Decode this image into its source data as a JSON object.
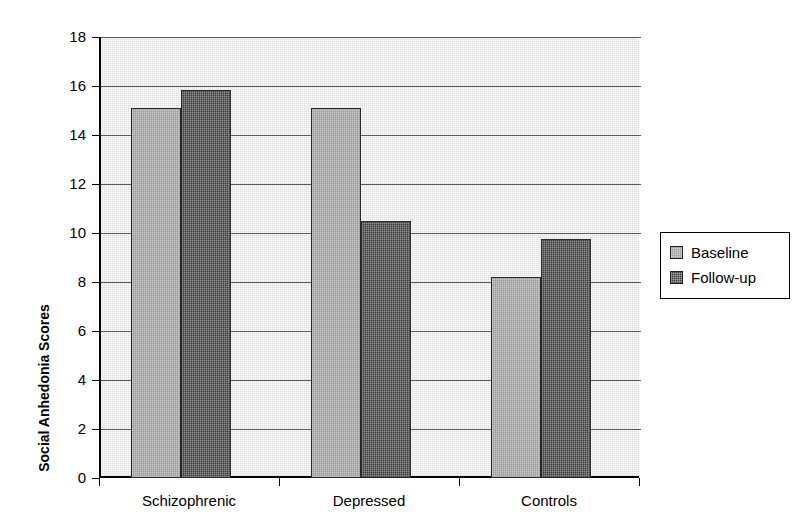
{
  "chart_data": {
    "type": "bar",
    "title": "",
    "subtitle": "",
    "xlabel": "",
    "ylabel": "Social Anhedonia Scores",
    "categories": [
      "Schizophrenic",
      "Depressed",
      "Controls"
    ],
    "series": [
      {
        "name": "Baseline",
        "values": [
          15.1,
          15.1,
          8.2
        ],
        "color": "#9c9c9c"
      },
      {
        "name": "Follow-up",
        "values": [
          15.85,
          10.5,
          9.75
        ],
        "color": "#3d3d3d"
      }
    ],
    "ylim": [
      0,
      18
    ],
    "ytick_step": 2,
    "ytick_labels": [
      "18",
      "16",
      "14",
      "12",
      "10",
      "8",
      "6",
      "4",
      "2",
      "0"
    ],
    "ytick_values": [
      18,
      16,
      14,
      12,
      10,
      8,
      6,
      4,
      2,
      0
    ],
    "grid": "horizontal",
    "legend_position": "right",
    "plot_background_color": "#dedede",
    "axis_color": "#000000",
    "gridline_color": "#5b5b5b",
    "figure_background_color": "#ffffff"
  },
  "legend": {
    "entries": [
      {
        "label": "Baseline",
        "swatch_icon": "square-swatch-light"
      },
      {
        "label": "Follow-up",
        "swatch_icon": "square-swatch-dark"
      }
    ]
  }
}
